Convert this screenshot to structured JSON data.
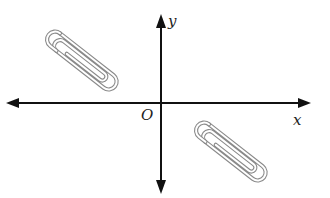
{
  "diagram": {
    "axes": {
      "x_label": "x",
      "y_label": "y",
      "origin_label": "O",
      "origin": [
        161,
        103
      ],
      "x_range_px": [
        6,
        310
      ],
      "y_range_px": [
        14,
        194
      ]
    },
    "objects": [
      {
        "name": "paper-clip",
        "quadrant": "II",
        "center": [
          85,
          63
        ],
        "angle_deg": 38
      },
      {
        "name": "paper-clip",
        "quadrant": "IV",
        "center": [
          234,
          154
        ],
        "angle_deg": 38
      }
    ],
    "colors": {
      "axis": "#111111",
      "clip": "#8a8a8a",
      "text": "#222222"
    }
  }
}
